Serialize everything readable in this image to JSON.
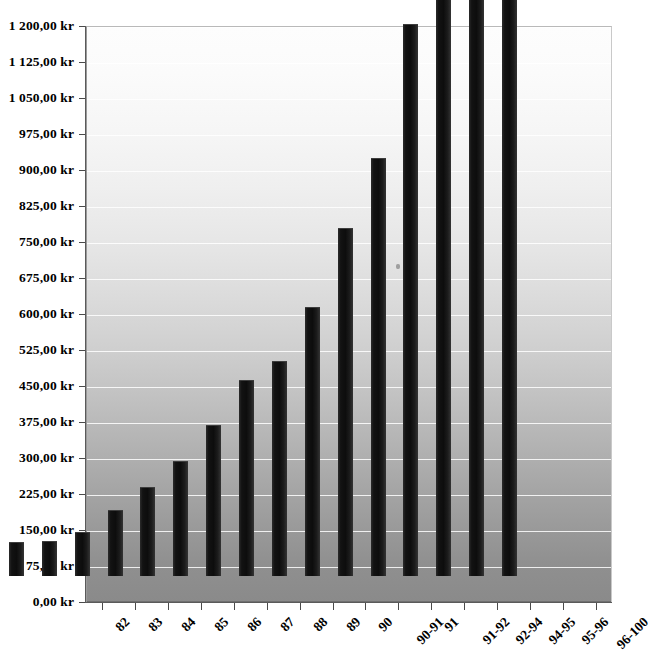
{
  "chart_data": {
    "type": "bar",
    "title": "",
    "subtitle": "",
    "xlabel": "",
    "ylabel": "",
    "categories": [
      "82",
      "83",
      "84",
      "85",
      "86",
      "87",
      "88",
      "89",
      "90",
      "90-91",
      "91",
      "91-92",
      "92-94",
      "94-95",
      "95-96",
      "96-100"
    ],
    "values": [
      70,
      72,
      92,
      137,
      185,
      240,
      315,
      408,
      448,
      560,
      725,
      870,
      1150,
      1290,
      1290,
      1290
    ],
    "clipped_above_axis": [
      "94-95",
      "95-96",
      "96-100"
    ],
    "ylim": [
      0,
      1200
    ],
    "ytick_step": 75,
    "ytick_labels": [
      "0,00 kr",
      "75,00 kr",
      "150,00 kr",
      "225,00 kr",
      "300,00 kr",
      "375,00 kr",
      "450,00 kr",
      "525,00 kr",
      "600,00 kr",
      "675,00 kr",
      "750,00 kr",
      "825,00 kr",
      "900,00 kr",
      "975,00 kr",
      "1 050,00 kr",
      "1 125,00 kr",
      "1 200,00 kr"
    ],
    "ytick_values": [
      0,
      75,
      150,
      225,
      300,
      375,
      450,
      525,
      600,
      675,
      750,
      825,
      900,
      975,
      1050,
      1125,
      1200
    ],
    "currency_suffix": "kr",
    "decimal_separator": ",",
    "thousands_separator": " ",
    "grid": true,
    "grid_orientation": "horizontal",
    "legend": "none",
    "legend_position": "none",
    "series": [
      {
        "name": "",
        "values": [
          70,
          72,
          92,
          137,
          185,
          240,
          315,
          408,
          448,
          560,
          725,
          870,
          1150,
          1290,
          1290,
          1290
        ]
      }
    ],
    "xlabel_rotation_deg": -45,
    "colors": {
      "bar": "#121212",
      "gridline": "#ffffff",
      "axis": "#4a4a4a",
      "text": "#000000",
      "plot_background_top": "#fdfdfd",
      "plot_background_bottom": "#8a8a8a",
      "page_background": "#ffffff"
    }
  },
  "caption": {
    "text": ""
  }
}
